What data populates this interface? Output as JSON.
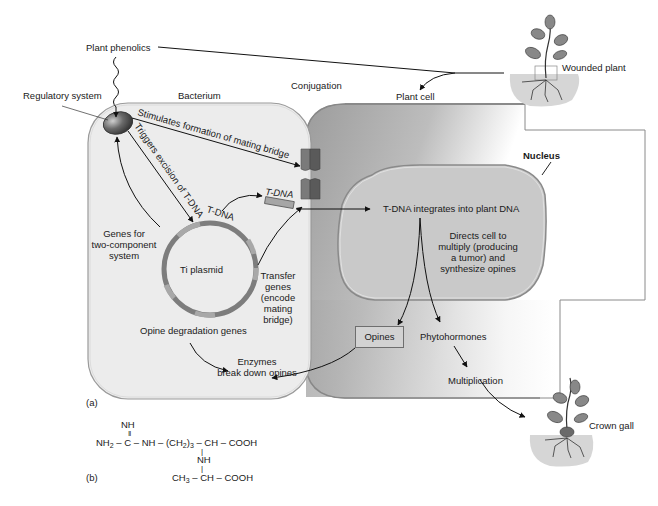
{
  "figure": {
    "panel_a_label": "(a)",
    "panel_b_label": "(b)",
    "colors": {
      "bacterium_fill": "#ececec",
      "plant_cell_fill": "#b8b8b8",
      "nucleus_fill": "#c9c9c9",
      "plasmid_ring": "#7d7d7d",
      "plasmid_segment": "#a8a8a8",
      "bridge_protein": "#6a6a6a",
      "soil": "#d6d6d6",
      "arrow": "#111111"
    }
  },
  "labels": {
    "plant_phenolics": "Plant phenolics",
    "regulatory_system": "Regulatory system",
    "bacterium": "Bacterium",
    "conjugation": "Conjugation",
    "plant_cell": "Plant cell",
    "wounded_plant": "Wounded plant",
    "stimulates_bridge": "Stimulates formation of mating bridge",
    "triggers_excision": "Triggers excision of T-DNA",
    "t_dna_plasmid": "T-DNA",
    "t_dna_fragment": "T-DNA",
    "genes_two_component": [
      "Genes for",
      "two-component",
      "system"
    ],
    "ti_plasmid": "Ti plasmid",
    "transfer_genes": [
      "Transfer",
      "genes",
      "(encode",
      "mating",
      "bridge)"
    ],
    "opine_degradation": "Opine degradation genes",
    "enzymes": [
      "Enzymes",
      "break down opines"
    ],
    "nucleus": "Nucleus",
    "t_dna_integrates": "T-DNA integrates into plant DNA",
    "directs_cell": [
      "Directs cell to",
      "multiply (producing",
      "a tumor) and",
      "synthesize opines"
    ],
    "opines": "Opines",
    "phytohormones": "Phytohormones",
    "multiplication": "Multiplication",
    "crown_gall": "Crown gall"
  },
  "chemical_structure": {
    "name": "Octopine",
    "line1": "NH",
    "line2_double_bond": "‖",
    "line3_parts": [
      "NH",
      "2",
      " – C – NH – (CH",
      "2",
      ")",
      "3",
      " – CH – COOH"
    ],
    "line4_bond": "|",
    "line5": "NH",
    "line6_bond": "|",
    "line7_parts": [
      "CH",
      "3",
      " – CH – COOH"
    ]
  }
}
